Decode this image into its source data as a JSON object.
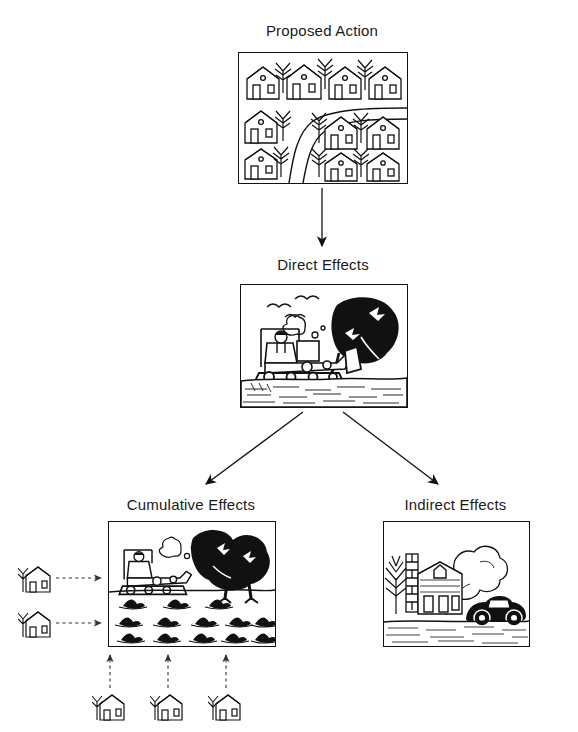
{
  "diagram": {
    "title_visible": false,
    "background_color": "#ffffff",
    "line_color": "#111111",
    "nodes": [
      {
        "id": "proposed-action",
        "label": "Proposed Action",
        "label_x": 322,
        "label_y": 22,
        "panel": {
          "x": 238,
          "y": 52,
          "w": 168,
          "h": 130
        },
        "scene": "residential-subdivision-with-road-and-trees"
      },
      {
        "id": "direct-effects",
        "label": "Direct Effects",
        "label_x": 322,
        "label_y": 256,
        "panel": {
          "x": 240,
          "y": 284,
          "w": 166,
          "h": 122
        },
        "scene": "bulldozer-clearing-tree-with-birds-fleeing"
      },
      {
        "id": "cumulative-effects",
        "label": "Cumulative Effects",
        "label_x": 190,
        "label_y": 496,
        "panel": {
          "x": 108,
          "y": 521,
          "w": 166,
          "h": 124
        },
        "scene": "bulldozer-with-dark-trees-and-rows-of-stumps"
      },
      {
        "id": "indirect-effects",
        "label": "Indirect Effects",
        "label_x": 455,
        "label_y": 496,
        "panel": {
          "x": 383,
          "y": 521,
          "w": 145,
          "h": 124
        },
        "scene": "house-with-smoking-chimney-and-car-exhaust"
      }
    ],
    "arrows": [
      {
        "id": "proposed-to-direct",
        "style": "solid",
        "from": "proposed-action",
        "to": "direct-effects"
      },
      {
        "id": "direct-to-cumulative",
        "style": "solid",
        "from": "direct-effects",
        "to": "cumulative-effects"
      },
      {
        "id": "direct-to-indirect",
        "style": "solid",
        "from": "direct-effects",
        "to": "indirect-effects"
      }
    ],
    "contributor_houses": {
      "left": [
        {
          "id": "left-house-1",
          "x": 18,
          "y": 562,
          "arrow_to_x": 104
        },
        {
          "id": "left-house-2",
          "x": 18,
          "y": 607,
          "arrow_to_x": 104
        }
      ],
      "bottom": [
        {
          "id": "bottom-house-1",
          "x": 92,
          "y": 690,
          "arrow_to_y": 652
        },
        {
          "id": "bottom-house-2",
          "x": 150,
          "y": 690,
          "arrow_to_y": 652
        },
        {
          "id": "bottom-house-3",
          "x": 208,
          "y": 690,
          "arrow_to_y": 652
        }
      ],
      "arrow_style": "dashed"
    }
  }
}
